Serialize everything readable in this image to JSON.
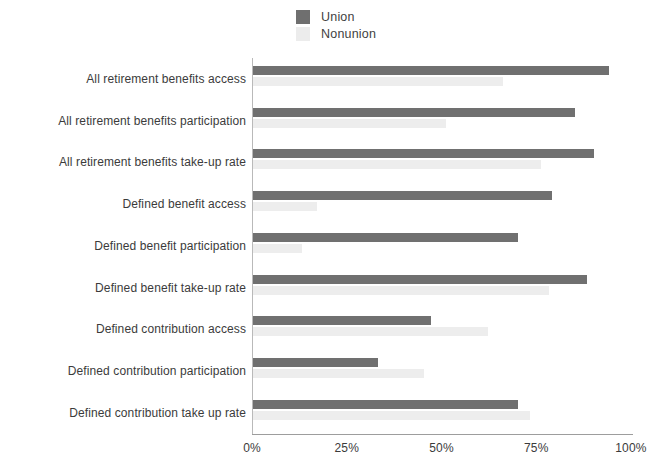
{
  "legend": {
    "position": "top-center",
    "items": [
      {
        "label": "Union",
        "color": "#707070",
        "icon": "square-swatch"
      },
      {
        "label": "Nonunion",
        "color": "#ededed",
        "icon": "square-swatch"
      }
    ]
  },
  "axis": {
    "x_ticks": [
      "0%",
      "25%",
      "50%",
      "75%",
      "100%"
    ],
    "x_tick_values": [
      0,
      25,
      50,
      75,
      100
    ]
  },
  "categories": [
    "All retirement benefits access",
    "All retirement benefits participation",
    "All retirement benefits take-up rate",
    "Defined benefit access",
    "Defined benefit participation",
    "Defined benefit take-up rate",
    "Defined contribution access",
    "Defined contribution participation",
    "Defined contribution take up rate"
  ],
  "chart_data": {
    "type": "bar",
    "orientation": "horizontal",
    "title": "",
    "subtitle": "",
    "xlabel": "",
    "ylabel": "",
    "xlim": [
      0,
      100
    ],
    "x_unit": "percent",
    "grid": false,
    "legend_position": "top-center",
    "categories": [
      "All retirement benefits access",
      "All retirement benefits participation",
      "All retirement benefits take-up rate",
      "Defined benefit access",
      "Defined benefit participation",
      "Defined benefit take-up rate",
      "Defined contribution access",
      "Defined contribution participation",
      "Defined contribution take up rate"
    ],
    "series": [
      {
        "name": "Union",
        "color": "#707070",
        "values": [
          94,
          85,
          90,
          79,
          70,
          88,
          47,
          33,
          70
        ]
      },
      {
        "name": "Nonunion",
        "color": "#ededed",
        "values": [
          66,
          51,
          76,
          17,
          13,
          78,
          62,
          45,
          73
        ]
      }
    ],
    "x_ticks": [
      0,
      25,
      50,
      75,
      100
    ],
    "x_tick_labels": [
      "0%",
      "25%",
      "50%",
      "75%",
      "100%"
    ]
  }
}
